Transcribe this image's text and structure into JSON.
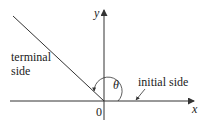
{
  "diagram": {
    "labels": {
      "y_axis": "y",
      "x_axis": "x",
      "origin": "0",
      "theta": "θ",
      "terminal_line1": "terminal",
      "terminal_line2": "side",
      "initial": "initial side"
    },
    "colors": {
      "line": "#333333",
      "background": "#ffffff"
    },
    "geometry": {
      "origin": [
        104,
        101
      ],
      "terminal_angle_deg": 135
    }
  }
}
